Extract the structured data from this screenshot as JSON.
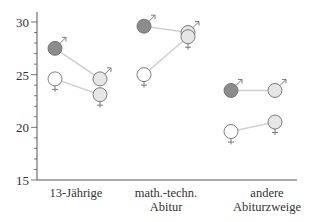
{
  "chart_data": {
    "type": "scatter",
    "title": "",
    "xlabel": "",
    "ylabel": "",
    "ylim": [
      15,
      30
    ],
    "yticks": [
      15,
      20,
      25,
      30
    ],
    "grid": false,
    "legend": "none (symbols ♂ / ♀ mark series)",
    "categories": [
      {
        "lines": [
          "13-Jährige"
        ]
      },
      {
        "lines": [
          "math.-techn.",
          "Abitur"
        ]
      },
      {
        "lines": [
          "andere",
          "Abiturzweige"
        ]
      }
    ],
    "series": [
      {
        "name": "♂ (first measurement)",
        "symbol": "male",
        "fill": "#8c8c8c",
        "position": "left",
        "values": [
          27.5,
          29.6,
          23.5
        ]
      },
      {
        "name": "♀ (first measurement)",
        "symbol": "female",
        "fill": "#ffffff",
        "position": "left",
        "values": [
          24.6,
          25.0,
          19.6
        ]
      },
      {
        "name": "♂ (second measurement)",
        "symbol": "male",
        "fill": "#e6e6e6",
        "position": "right",
        "values": [
          24.6,
          29.0,
          23.5
        ]
      },
      {
        "name": "♀ (second measurement)",
        "symbol": "female",
        "fill": "#e6e6e6",
        "position": "right",
        "values": [
          23.1,
          28.6,
          20.5
        ]
      }
    ],
    "connections": [
      {
        "from": 0,
        "to": 2
      },
      {
        "from": 1,
        "to": 3
      }
    ]
  },
  "colors": {
    "axis": "#555555",
    "marker_stroke": "#6e6e6e",
    "connector": "#cfcfcf",
    "text": "#333333"
  }
}
